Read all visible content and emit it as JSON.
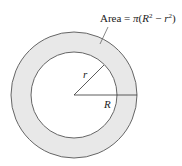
{
  "diagram": {
    "type": "annulus",
    "area_label": {
      "prefix": "Area = ",
      "pi": "π",
      "open": "(",
      "R": "R",
      "sup2a": "2",
      "minus": " − ",
      "r": "r",
      "sup2b": "2",
      "close": ")"
    },
    "inner_radius_label": "r",
    "outer_radius_label": "R",
    "colors": {
      "ring_fill": "#e8e8e8",
      "stroke": "#555555",
      "background": "#ffffff"
    }
  }
}
